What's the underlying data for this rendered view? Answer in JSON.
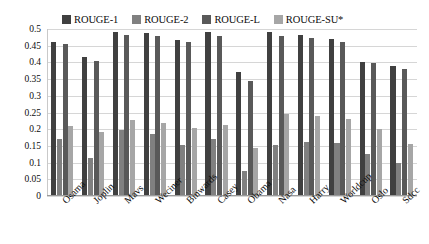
{
  "chart_data": {
    "type": "bar",
    "title": "",
    "xlabel": "",
    "ylabel": "",
    "ylim": [
      0,
      0.5
    ],
    "ytick_labels": [
      "0.5",
      "0.45",
      "0.4",
      "0.35",
      "0.3",
      "0.25",
      "0.2",
      "0.15",
      "0.1",
      "0.05",
      "0"
    ],
    "ytick_values": [
      0.5,
      0.45,
      0.4,
      0.35,
      0.3,
      0.25,
      0.2,
      0.15,
      0.1,
      0.05,
      0
    ],
    "grid": true,
    "legend_position": "top",
    "categories": [
      "Osama",
      "Joplin",
      "Mavs",
      "Weciner",
      "Binwards",
      "Casey",
      "Obama",
      "Nasa",
      "Harry",
      "Worldcup",
      "Oslo",
      "Sdcc"
    ],
    "series": [
      {
        "name": "ROUGE-1",
        "color": "#404040",
        "values": [
          0.46,
          0.415,
          0.492,
          0.487,
          0.468,
          0.49,
          0.37,
          0.492,
          0.482,
          0.47,
          0.402,
          0.388
        ]
      },
      {
        "name": "ROUGE-2",
        "color": "#808080",
        "values": [
          0.17,
          0.113,
          0.198,
          0.187,
          0.152,
          0.17,
          0.075,
          0.152,
          0.162,
          0.158,
          0.125,
          0.1
        ]
      },
      {
        "name": "ROUGE-L",
        "color": "#595959",
        "values": [
          0.455,
          0.405,
          0.482,
          0.48,
          0.462,
          0.478,
          0.345,
          0.48,
          0.472,
          0.462,
          0.398,
          0.38
        ]
      },
      {
        "name": "ROUGE-SU*",
        "color": "#a6a6a6",
        "values": [
          0.21,
          0.192,
          0.228,
          0.22,
          0.205,
          0.213,
          0.145,
          0.245,
          0.24,
          0.232,
          0.2,
          0.155
        ]
      }
    ]
  }
}
